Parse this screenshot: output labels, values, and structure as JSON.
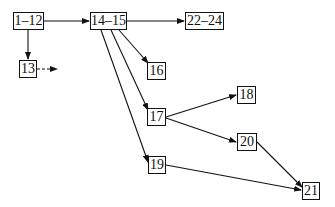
{
  "nodes": {
    "n1_12": "1–12",
    "n13": "13",
    "n14_15": "14–15",
    "n16": "16",
    "n17": "17",
    "n18": "18",
    "n19": "19",
    "n20": "20",
    "n21": "21",
    "n22_24": "22–24"
  },
  "edges": [
    {
      "from": "1–12",
      "to": "14–15"
    },
    {
      "from": "1–12",
      "to": "13"
    },
    {
      "from": "13",
      "to": "...",
      "style": "dashed"
    },
    {
      "from": "14–15",
      "to": "22–24"
    },
    {
      "from": "14–15",
      "to": "16"
    },
    {
      "from": "14–15",
      "to": "17"
    },
    {
      "from": "14–15",
      "to": "19"
    },
    {
      "from": "17",
      "to": "18"
    },
    {
      "from": "17",
      "to": "20"
    },
    {
      "from": "20",
      "to": "21"
    },
    {
      "from": "19",
      "to": "21"
    }
  ]
}
